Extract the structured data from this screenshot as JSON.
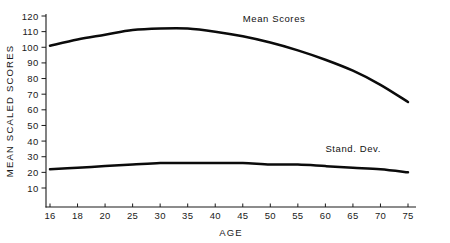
{
  "chart_data": {
    "type": "line",
    "title": "",
    "xlabel": "AGE",
    "ylabel": "MEAN SCALED SCORES",
    "grid": false,
    "legend_position": "inline-annotations",
    "x_tick_labels": [
      "16",
      "18",
      "20",
      "25",
      "30",
      "35",
      "40",
      "45",
      "50",
      "55",
      "60",
      "65",
      "70",
      "75"
    ],
    "x": [
      16,
      18,
      20,
      25,
      30,
      35,
      40,
      45,
      50,
      55,
      60,
      65,
      70,
      75
    ],
    "x_spacing": "ordinal",
    "y_tick_labels": [
      "10",
      "20",
      "30",
      "40",
      "50",
      "60",
      "70",
      "80",
      "90",
      "100",
      "110",
      "120"
    ],
    "ylim": [
      0,
      120
    ],
    "y_ticks": [
      10,
      20,
      30,
      40,
      50,
      60,
      70,
      80,
      90,
      100,
      110,
      120
    ],
    "series": [
      {
        "name": "Mean Scores",
        "label": "Mean Scores",
        "color": "#0b0b0b",
        "values": [
          101,
          105,
          108,
          111,
          112,
          112,
          110,
          107,
          103,
          98,
          92,
          85,
          76,
          65
        ]
      },
      {
        "name": "Stand. Dev.",
        "label": "Stand. Dev.",
        "color": "#0b0b0b",
        "values": [
          22,
          23,
          24,
          25,
          26,
          26,
          26,
          26,
          25,
          25,
          24,
          23,
          22,
          20
        ]
      }
    ],
    "annotations": [
      {
        "text": "Mean Scores",
        "x": 45,
        "y": 116
      },
      {
        "text": "Stand. Dev.",
        "x": 60,
        "y": 33
      }
    ]
  }
}
